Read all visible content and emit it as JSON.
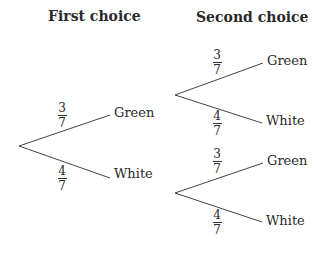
{
  "headings": {
    "first": "First choice",
    "second": "Second choice"
  },
  "tree": {
    "first": {
      "upper": {
        "prob_num": "3",
        "prob_den": "7",
        "outcome": "Green"
      },
      "lower": {
        "prob_num": "4",
        "prob_den": "7",
        "outcome": "White"
      }
    },
    "second_after_green": {
      "upper": {
        "prob_num": "3",
        "prob_den": "7",
        "outcome": "Green"
      },
      "lower": {
        "prob_num": "4",
        "prob_den": "7",
        "outcome": "White"
      }
    },
    "second_after_white": {
      "upper": {
        "prob_num": "3",
        "prob_den": "7",
        "outcome": "Green"
      },
      "lower": {
        "prob_num": "4",
        "prob_den": "7",
        "outcome": "White"
      }
    }
  },
  "colors": {
    "line": "#444444",
    "text": "#2a2a2a",
    "background": "#ffffff"
  }
}
